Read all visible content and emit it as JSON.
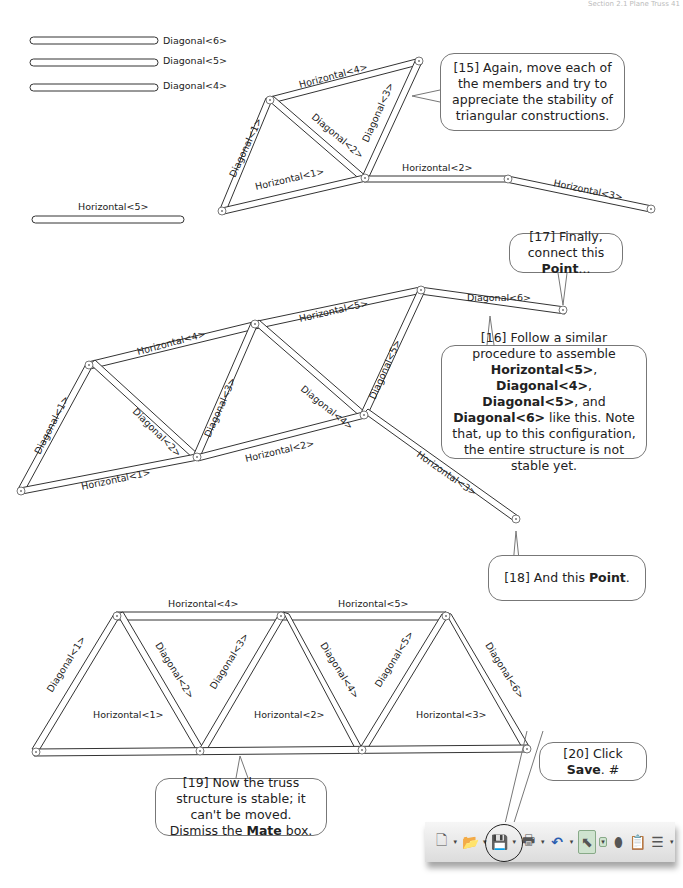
{
  "header": {
    "text": "Section 2.1  Plane Truss    41"
  },
  "loose_members": [
    {
      "label": "Diagonal<6>"
    },
    {
      "label": "Diagonal<5>"
    },
    {
      "label": "Diagonal<4>"
    },
    {
      "label": "Horizontal<5>"
    }
  ],
  "figure1": {
    "labels": {
      "h4": "Horizontal<4>",
      "d1": "Diagonal<1>",
      "d2": "Diagonal<2>",
      "d3": "Diagonal<3>",
      "h1": "Horizontal<1>",
      "h2": "Horizontal<2>",
      "h3": "Horizontal<3>"
    }
  },
  "figure2": {
    "labels": {
      "h4": "Horizontal<4>",
      "h5": "Horizontal<5>",
      "d1": "Diagonal<1>",
      "d2": "Diagonal<2>",
      "d3": "Diagonal<3>",
      "d4": "Diagonal<4>",
      "d5": "Diagonal<5>",
      "d6": "Diagonal<6>",
      "h1": "Horizontal<1>",
      "h2": "Horizontal<2>",
      "h3": "Horizontal<3>"
    }
  },
  "figure3": {
    "labels": {
      "h4": "Horizontal<4>",
      "h5": "Horizontal<5>",
      "d1": "Diagonal<1>",
      "d2": "Diagonal<2>",
      "d3": "Diagonal<3>",
      "d4": "Diagonal<4>",
      "d5": "Diagonal<5>",
      "d6": "Diagonal<6>",
      "h1": "Horizontal<1>",
      "h2": "Horizontal<2>",
      "h3": "Horizontal<3>"
    }
  },
  "callouts": {
    "c15": {
      "text": "[15] Again, move each of the members and try to appreciate the stability of triangular constructions."
    },
    "c16": {
      "pre": "[16] Follow a similar procedure to assemble ",
      "b1": "Horizontal<5>",
      "s1": ", ",
      "b2": "Diagonal<4>",
      "s2": ", ",
      "b3": "Diagonal<5>",
      "s3": ", and ",
      "b4": "Diagonal<6>",
      "post": " like this.  Note that, up to this configuration, the entire structure is not stable yet."
    },
    "c17": {
      "pre": "[17] Finally, connect this ",
      "bold": "Point",
      "post": "..."
    },
    "c18": {
      "pre": "[18] And this ",
      "bold": "Point",
      "post": "."
    },
    "c19": {
      "pre": "[19] Now the truss structure is stable; it can't be moved. Dismiss the ",
      "bold": "Mate",
      "post": " box."
    },
    "c20": {
      "pre": "[20] Click ",
      "bold": "Save",
      "post": ". #"
    }
  },
  "toolbar": {
    "buttons": [
      {
        "name": "new-document",
        "glyph": "🗋"
      },
      {
        "name": "open",
        "glyph": "📂"
      },
      {
        "name": "save",
        "glyph": "💾"
      },
      {
        "name": "print",
        "glyph": "🖶"
      },
      {
        "name": "undo",
        "glyph": "↶"
      },
      {
        "name": "select",
        "glyph": "⬉"
      },
      {
        "name": "rebuild",
        "glyph": "⬮"
      },
      {
        "name": "file-properties",
        "glyph": "📋"
      },
      {
        "name": "options",
        "glyph": "☰"
      }
    ],
    "dropdown_glyph": "▾"
  }
}
